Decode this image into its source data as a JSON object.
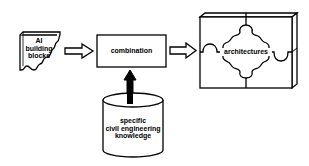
{
  "diagram": {
    "nodes": {
      "building_blocks": {
        "label_lines": [
          "AI",
          "building",
          "blocks"
        ]
      },
      "combination": {
        "label": "combination"
      },
      "knowledge": {
        "label_lines": [
          "specific",
          "civil engineering",
          "knowledge"
        ]
      },
      "architectures": {
        "label": "architectures"
      }
    },
    "edges": [
      {
        "from": "building_blocks",
        "to": "combination",
        "style": "hollow-arrow"
      },
      {
        "from": "combination",
        "to": "architectures",
        "style": "hollow-arrow"
      },
      {
        "from": "knowledge",
        "to": "combination",
        "style": "solid-arrow"
      }
    ],
    "colors": {
      "stroke": "#000000",
      "background": "#ffffff"
    }
  }
}
